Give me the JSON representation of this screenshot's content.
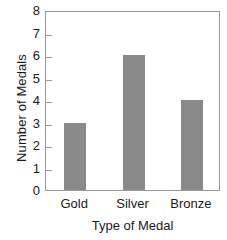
{
  "chart_data": {
    "type": "bar",
    "title": "",
    "xlabel": "Type of Medal",
    "ylabel": "Number of Medals",
    "categories": [
      "Gold",
      "Silver",
      "Bronze"
    ],
    "values": [
      3,
      6,
      4
    ],
    "ylim": [
      0,
      8
    ],
    "yticks": [
      0,
      1,
      2,
      3,
      4,
      5,
      6,
      7,
      8
    ],
    "ytick_labels": [
      "0",
      "1",
      "2",
      "3",
      "4",
      "5",
      "6",
      "7",
      "8"
    ],
    "grid": false,
    "legend": false,
    "legend_position": "none",
    "bar_color": "#8a8a8a",
    "frame_color": "#9a9a9a",
    "background_color": "#ffffff",
    "text_color": "#1a1a1a"
  }
}
